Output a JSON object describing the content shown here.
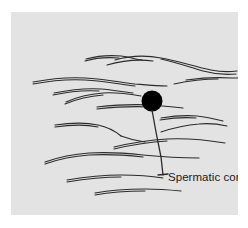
{
  "figure": {
    "type": "anatomical-line-drawing",
    "caption_label": "Spermatic cord",
    "panel": {
      "background_color": "#e3e3e3",
      "x": 11,
      "y": 12,
      "width": 227,
      "height": 203
    },
    "ink_color": "#2b2b2b",
    "marker": {
      "name": "spermatic-cord-marker",
      "shape": "filled-circle",
      "color": "#000000",
      "cx": 141,
      "cy": 89,
      "r": 10.5
    },
    "leader_line": {
      "name": "leader-line",
      "color": "#2b2b2b",
      "points": "141,98 145,120 150,145 152,163",
      "tick": "147,163 157,162"
    },
    "fiber_strokes": [
      "M104,48 C118,44 134,43 150,46 C168,49 184,55 200,58 C210,60 218,60 226,59",
      "M225,62 C214,63 203,62 192,59 C178,55 164,50 150,47",
      "M96,53 C110,49 126,47 142,49",
      "M75,47 C86,44 98,43 110,44 C118,45 124,47 131,48",
      "M74,49 C84,46 96,45 108,46",
      "M175,68 C190,66 205,65 220,66 C224,66 226,66 227,66",
      "M163,72 C177,69 192,67 207,67",
      "M22,70 C38,67 56,65 74,66 C92,67 108,70 124,72 C136,73 146,74 156,74",
      "M22,72 C38,69 56,67 74,68 C92,69 108,72 124,74",
      "M43,81 C58,78 74,76 90,77 C102,78 112,80 122,81",
      "M42,83 C56,80 72,78 88,79",
      "M55,90 C66,85 79,82 92,81 C106,80 118,82 130,84",
      "M54,92 C66,87 79,84 92,83",
      "M86,95 C104,93 122,92 140,93 C152,94 162,95 172,96",
      "M86,97 C104,95 122,94 140,95",
      "M150,106 C162,104 174,103 186,104 C196,105 204,107 212,109",
      "M149,108 C161,106 173,105 185,106",
      "M150,120 C162,116 175,113 188,112 C198,111 207,112 216,114",
      "M44,113 C58,111 73,110 87,113 C97,115 104,119 110,124",
      "M44,115 C58,113 73,112 87,115",
      "M110,124 C118,127 126,129 134,130",
      "M103,135 C120,131 138,128 156,127 C176,126 196,128 214,131",
      "M103,137 C120,133 138,130 156,129",
      "M34,150 C48,145 63,142 78,141 C96,140 114,141 132,143 C152,145 170,146 188,146",
      "M34,152 C48,147 63,144 78,143 C96,142 114,143 132,145",
      "M56,168 C74,165 92,163 110,163 C126,163 140,164 152,166",
      "M56,170 C74,167 92,165 110,165",
      "M84,181 C100,178 117,177 134,177 C148,177 160,178 170,179",
      "M84,183 C100,180 117,179 134,179"
    ]
  }
}
